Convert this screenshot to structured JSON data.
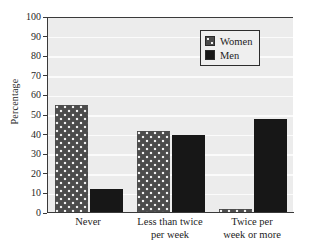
{
  "chart_data": {
    "type": "bar",
    "title": "",
    "xlabel": "",
    "ylabel": "Percentage",
    "ylim": [
      0,
      100
    ],
    "ytick_step": 10,
    "yticks": [
      100,
      90,
      80,
      70,
      60,
      50,
      40,
      30,
      20,
      10,
      0
    ],
    "grid": "horizontal",
    "legend_position": "top-right",
    "categories": [
      "Never",
      "Less than twice per week",
      "Twice per week or more"
    ],
    "category_lines": [
      [
        "Never"
      ],
      [
        "Less than twice",
        "per week"
      ],
      [
        "Twice per",
        "week or more"
      ]
    ],
    "series": [
      {
        "name": "Women",
        "values": [
          55,
          42,
          2
        ],
        "pattern": "dotted",
        "color": "#4c4c4c"
      },
      {
        "name": "Men",
        "values": [
          12,
          40,
          48
        ],
        "pattern": "solid",
        "color": "#171717"
      }
    ]
  },
  "legend": {
    "items": [
      {
        "label": "Women",
        "swatch": "women-dotted-swatch"
      },
      {
        "label": "Men",
        "swatch": "men-solid-swatch"
      }
    ]
  },
  "axis": {
    "y_title": "Percentage",
    "y_tick_labels": [
      "100",
      "90",
      "80",
      "70",
      "60",
      "50",
      "40",
      "30",
      "20",
      "10",
      "0"
    ]
  },
  "colors": {
    "plot_background": "#ececec",
    "gridline": "#fbfbfb",
    "axis": "#3a3a3a",
    "women_bar": "#4c4c4c",
    "men_bar": "#171717",
    "text": "#1d1d1d"
  }
}
